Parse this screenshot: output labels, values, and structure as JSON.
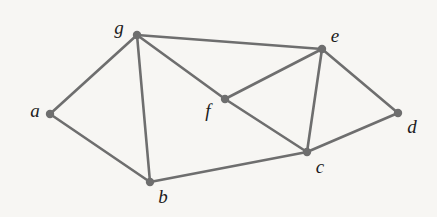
{
  "figure": {
    "kind": "undirected-graph-diagram",
    "background_color": "#f7f6f3",
    "edge_color": "#6e6e6e",
    "node_color": "#6e6e6e",
    "label_color": "#1c1c1c",
    "node_count": 7,
    "edge_count": 11
  },
  "nodes": [
    {
      "id": "a",
      "label": "a",
      "x": 50,
      "y": 114,
      "r": 4.2,
      "label_x": 35,
      "label_y": 110
    },
    {
      "id": "b",
      "label": "b",
      "x": 150,
      "y": 182,
      "r": 4.2,
      "label_x": 163,
      "label_y": 196
    },
    {
      "id": "c",
      "label": "c",
      "x": 307,
      "y": 152,
      "r": 4.2,
      "label_x": 320,
      "label_y": 166
    },
    {
      "id": "d",
      "label": "d",
      "x": 398,
      "y": 113,
      "r": 4.2,
      "label_x": 412,
      "label_y": 126
    },
    {
      "id": "e",
      "label": "e",
      "x": 322,
      "y": 49,
      "r": 4.2,
      "label_x": 335,
      "label_y": 35
    },
    {
      "id": "f",
      "label": "f",
      "x": 225,
      "y": 99,
      "r": 4.2,
      "label_x": 208,
      "label_y": 110
    },
    {
      "id": "g",
      "label": "g",
      "x": 137,
      "y": 35,
      "r": 4.2,
      "label_x": 119,
      "label_y": 27
    }
  ],
  "edges": [
    {
      "id": "a-g",
      "from": "a",
      "to": "g"
    },
    {
      "id": "a-b",
      "from": "a",
      "to": "b"
    },
    {
      "id": "g-b",
      "from": "g",
      "to": "b"
    },
    {
      "id": "g-e",
      "from": "g",
      "to": "e"
    },
    {
      "id": "g-f",
      "from": "g",
      "to": "f"
    },
    {
      "id": "f-e",
      "from": "f",
      "to": "e"
    },
    {
      "id": "f-c",
      "from": "f",
      "to": "c"
    },
    {
      "id": "e-c",
      "from": "e",
      "to": "c"
    },
    {
      "id": "e-d",
      "from": "e",
      "to": "d"
    },
    {
      "id": "c-d",
      "from": "c",
      "to": "d"
    },
    {
      "id": "b-c",
      "from": "b",
      "to": "c"
    }
  ]
}
